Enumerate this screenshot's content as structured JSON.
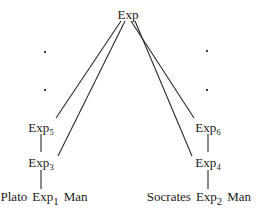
{
  "diagram": {
    "type": "expression-tree",
    "title": "Exp",
    "stroke_color": "#2b2b2b",
    "text_color": "#1a1a1a",
    "background": "#ffffff",
    "root": {
      "label": "Exp",
      "x": 128,
      "y": 14
    },
    "left_branch": {
      "upper": {
        "base": "Exp",
        "sub": "5",
        "x": 41,
        "y": 127
      },
      "lower": {
        "base": "Exp",
        "sub": "3",
        "x": 41,
        "y": 162
      },
      "leaf": {
        "left_word": "Plato",
        "base": "Exp",
        "sub": "1",
        "right_word": "Man",
        "x": 44,
        "y": 199
      }
    },
    "right_branch": {
      "upper": {
        "base": "Exp",
        "sub": "6",
        "x": 208,
        "y": 127
      },
      "lower": {
        "base": "Exp",
        "sub": "4",
        "x": 208,
        "y": 162
      },
      "leaf": {
        "left_word": "Socrates",
        "base": "Exp",
        "sub": "2",
        "right_word": "Man",
        "x": 199,
        "y": 199
      }
    },
    "ellipsis_dots": [
      {
        "x": 44,
        "y": 51
      },
      {
        "x": 44,
        "y": 89
      },
      {
        "x": 206,
        "y": 50
      },
      {
        "x": 206,
        "y": 89
      }
    ],
    "edges": [
      {
        "name": "root-to-exp5",
        "x1": 121,
        "y1": 21,
        "x2": 56,
        "y2": 118
      },
      {
        "name": "root-to-exp3",
        "x1": 125,
        "y1": 21,
        "x2": 58,
        "y2": 156
      },
      {
        "name": "root-to-exp6",
        "x1": 131,
        "y1": 21,
        "x2": 194,
        "y2": 118
      },
      {
        "name": "root-to-exp4",
        "x1": 135,
        "y1": 21,
        "x2": 192,
        "y2": 156
      },
      {
        "name": "exp5-to-exp3",
        "x1": 41,
        "y1": 134,
        "x2": 41,
        "y2": 152
      },
      {
        "name": "exp3-to-leaf1",
        "x1": 41,
        "y1": 170,
        "x2": 41,
        "y2": 189
      },
      {
        "name": "exp6-to-exp4",
        "x1": 208,
        "y1": 134,
        "x2": 208,
        "y2": 152
      },
      {
        "name": "exp4-to-leaf2",
        "x1": 208,
        "y1": 170,
        "x2": 208,
        "y2": 189
      }
    ]
  }
}
